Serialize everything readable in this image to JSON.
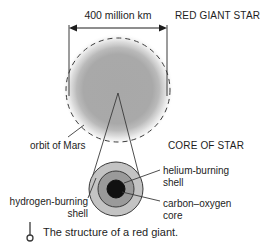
{
  "figure": {
    "title": "The structure of a red giant.",
    "diameter_label": "400 million km",
    "red_giant_label": "RED GIANT STAR",
    "orbit_label": "orbit of Mars",
    "core_of_star_label": "CORE OF STAR",
    "helium_shell_label_line1": "helium-burning",
    "helium_shell_label_line2": "shell",
    "carbon_core_label_line1": "carbon–oxygen",
    "carbon_core_label_line2": "core",
    "hydrogen_shell_label": "hydrogen-burning shell",
    "caption": "The structure of a red giant."
  },
  "colors": {
    "ink": "#1d1d1d",
    "line": "#3a3a3a",
    "star_gray": "#a8a8a8",
    "star_halo": "#d9d9d9",
    "outer_shell_gray": "#c3c3c3",
    "middle_shell_gray": "#9a9a9a",
    "core_black": "#111111",
    "background": "#ffffff"
  },
  "geometry": {
    "star_center_x": 118,
    "star_center_y": 89,
    "star_radius": 46,
    "orbit_radius": 52,
    "dimension_line_y": 28,
    "dimension_left_x": 69,
    "dimension_right_x": 167,
    "core_center_x": 116,
    "core_center_y": 189,
    "core_outer_radius": 27,
    "core_middle_radius": 18,
    "core_inner_radius": 9
  }
}
